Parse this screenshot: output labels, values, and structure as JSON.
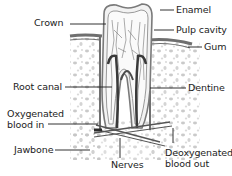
{
  "labels": {
    "crown": "Crown",
    "enamel": "Enamel",
    "pulp_cavity": "Pulp cavity",
    "gum": "Gum",
    "root_canal": "Root canal",
    "dentine": "Dentine",
    "oxygenated_line1": "Oxygenated",
    "oxygenated_line2": "blood in",
    "jawbone": "Jawbone",
    "nerves": "Nerves",
    "deoxygenated_line1": "Deoxygenated",
    "deoxygenated_line2": "blood out"
  },
  "colors": {
    "ink": "#1c1c1c",
    "bone_speckle": "#b8b8b8",
    "tooth_shade": "#8a8a8a",
    "background": "#ffffff"
  }
}
